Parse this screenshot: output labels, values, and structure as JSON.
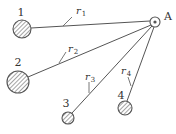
{
  "diagram": {
    "title": "",
    "colors": {
      "line": "#555555",
      "text": "#333333",
      "fill": "#ffffff",
      "hatch": "#666666"
    },
    "source": {
      "label": "A",
      "cx": 155,
      "cy": 22,
      "r_outer": 5,
      "r_inner": 1.6
    },
    "nodes": [
      {
        "id": "1",
        "label": "1",
        "cx": 22,
        "cy": 29,
        "r": 9,
        "label_x": 21,
        "label_y": 16
      },
      {
        "id": "2",
        "label": "2",
        "cx": 18,
        "cy": 82,
        "r": 11,
        "label_x": 18,
        "label_y": 66
      },
      {
        "id": "3",
        "label": "3",
        "cx": 68,
        "cy": 118,
        "r": 6,
        "label_x": 66,
        "label_y": 107
      },
      {
        "id": "4",
        "label": "4",
        "cx": 125,
        "cy": 108,
        "r": 7,
        "label_x": 121,
        "label_y": 99
      }
    ],
    "edges": [
      {
        "from": "1",
        "to": "A",
        "label": "r",
        "subscript": "1",
        "x1": 31,
        "y1": 28,
        "x2": 150,
        "y2": 21,
        "tick": {
          "x1": 63,
          "y1": 26,
          "x2": 72,
          "y2": 17
        },
        "label_x": 76,
        "label_y": 14
      },
      {
        "from": "2",
        "to": "A",
        "label": "r",
        "subscript": "2",
        "x1": 28,
        "y1": 77,
        "x2": 151,
        "y2": 25,
        "tick": {
          "x1": 59,
          "y1": 63,
          "x2": 66,
          "y2": 52
        },
        "label_x": 68,
        "label_y": 52
      },
      {
        "from": "3",
        "to": "A",
        "label": "r",
        "subscript": "3",
        "x1": 72,
        "y1": 113,
        "x2": 152,
        "y2": 26,
        "tick": {
          "x1": 89,
          "y1": 93,
          "x2": 89,
          "y2": 82
        },
        "label_x": 85,
        "label_y": 80
      },
      {
        "from": "4",
        "to": "A",
        "label": "r",
        "subscript": "4",
        "x1": 127,
        "y1": 101,
        "x2": 154,
        "y2": 27,
        "tick": {
          "x1": 131,
          "y1": 86,
          "x2": 128,
          "y2": 77
        },
        "label_x": 121,
        "label_y": 74
      }
    ]
  }
}
